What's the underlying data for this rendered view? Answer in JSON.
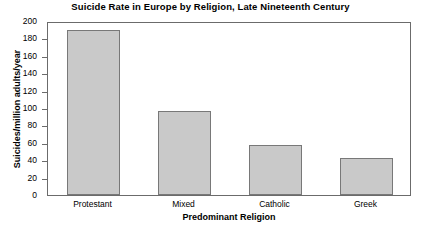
{
  "chart_data": {
    "type": "bar",
    "title": "Suicide Rate in Europe by Religion, Late Nineteenth Century",
    "xlabel": "Predominant Religion",
    "ylabel": "Suicides/million adults/year",
    "categories": [
      "Protestant",
      "Mixed",
      "Catholic",
      "Greek"
    ],
    "values": [
      190,
      96,
      58,
      42
    ],
    "ylim": [
      0,
      200
    ],
    "ytick_step": 20,
    "yticks": [
      200,
      180,
      160,
      140,
      120,
      100,
      80,
      60,
      40,
      20,
      0
    ],
    "grid": false,
    "legend": null,
    "bar_color": "#c9c9c9",
    "bar_edge_color": "#787878",
    "axis_color": "#6b6b6b"
  }
}
